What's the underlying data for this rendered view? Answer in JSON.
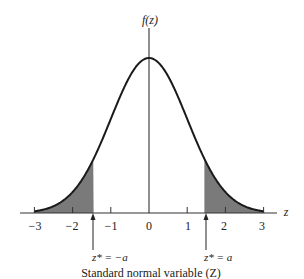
{
  "diagram": {
    "type": "standard-normal-distribution",
    "y_axis_label": "f(z)",
    "x_axis_label": "z",
    "x_ticks": [
      "−3",
      "−2",
      "−1",
      "0",
      "1",
      "2",
      "3"
    ],
    "x_tick_values": [
      -3,
      -2,
      -1,
      0,
      1,
      2,
      3
    ],
    "left_marker_label": "z* = −a",
    "right_marker_label": "z* = a",
    "caption": "Standard normal variable (Z)",
    "critical_value_a": 1.45,
    "shaded_regions": [
      "z < −a",
      "z > a"
    ],
    "colors": {
      "curve": "#1a1a1a",
      "shading": "#7a7a7a",
      "axis": "#333333"
    }
  }
}
